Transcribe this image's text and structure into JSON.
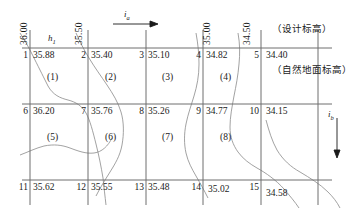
{
  "diagram": {
    "annotations": {
      "design_elevation_note": "（设计标高）",
      "natural_ground_note": "（自然地面标高）",
      "h1_label": "h",
      "h1_sub": "1",
      "slope_a_label": "i",
      "slope_a_sub": "a",
      "slope_b_label": "i",
      "slope_b_sub": "b"
    },
    "contour_labels": [
      {
        "text": "36.00",
        "x": 24,
        "y": 46
      },
      {
        "text": "35.50",
        "x": 79,
        "y": 46
      },
      {
        "text": "35.00",
        "x": 207,
        "y": 46
      },
      {
        "text": "34.50",
        "x": 247,
        "y": 46
      }
    ],
    "grid": {
      "columns": 6,
      "rows": 3,
      "x_lines": [
        30,
        88,
        146,
        203,
        261,
        318
      ],
      "y_lines": [
        48,
        104,
        160,
        180
      ],
      "points": [
        {
          "id": "1",
          "elevation": "35.88",
          "row": 0,
          "col": 0
        },
        {
          "id": "2",
          "elevation": "35.40",
          "row": 0,
          "col": 1
        },
        {
          "id": "3",
          "elevation": "35.10",
          "row": 0,
          "col": 2
        },
        {
          "id": "4",
          "elevation": "34.82",
          "row": 0,
          "col": 3
        },
        {
          "id": "5",
          "elevation": "34.40",
          "row": 0,
          "col": 4
        },
        {
          "id": "6",
          "elevation": "36.20",
          "row": 1,
          "col": 0
        },
        {
          "id": "7",
          "elevation": "35.76",
          "row": 1,
          "col": 1
        },
        {
          "id": "8",
          "elevation": "35.26",
          "row": 1,
          "col": 2
        },
        {
          "id": "9",
          "elevation": "34.77",
          "row": 1,
          "col": 3
        },
        {
          "id": "10",
          "elevation": "34.15",
          "row": 1,
          "col": 4
        },
        {
          "id": "11",
          "elevation": "35.62",
          "row": 2,
          "col": 0
        },
        {
          "id": "12",
          "elevation": "35.55",
          "row": 2,
          "col": 1
        },
        {
          "id": "13",
          "elevation": "35.48",
          "row": 2,
          "col": 2
        },
        {
          "id": "14",
          "elevation": "35.02",
          "row": 2,
          "col": 3
        },
        {
          "id": "15",
          "elevation": "34.58",
          "row": 2,
          "col": 4
        }
      ],
      "squares": [
        {
          "label": "(1)",
          "x": 53,
          "y": 74
        },
        {
          "label": "(2)",
          "x": 111,
          "y": 74
        },
        {
          "label": "(3)",
          "x": 168,
          "y": 74
        },
        {
          "label": "(4)",
          "x": 226,
          "y": 74
        },
        {
          "label": "(5)",
          "x": 53,
          "y": 130
        },
        {
          "label": "(6)",
          "x": 111,
          "y": 130
        },
        {
          "label": "(7)",
          "x": 168,
          "y": 130
        },
        {
          "label": "(8)",
          "x": 226,
          "y": 130
        }
      ]
    },
    "colors": {
      "grid_line": "#6f6f6f",
      "contour_line": "#8a8a8a",
      "text": "#1a1a1a",
      "background": "#ffffff"
    }
  }
}
